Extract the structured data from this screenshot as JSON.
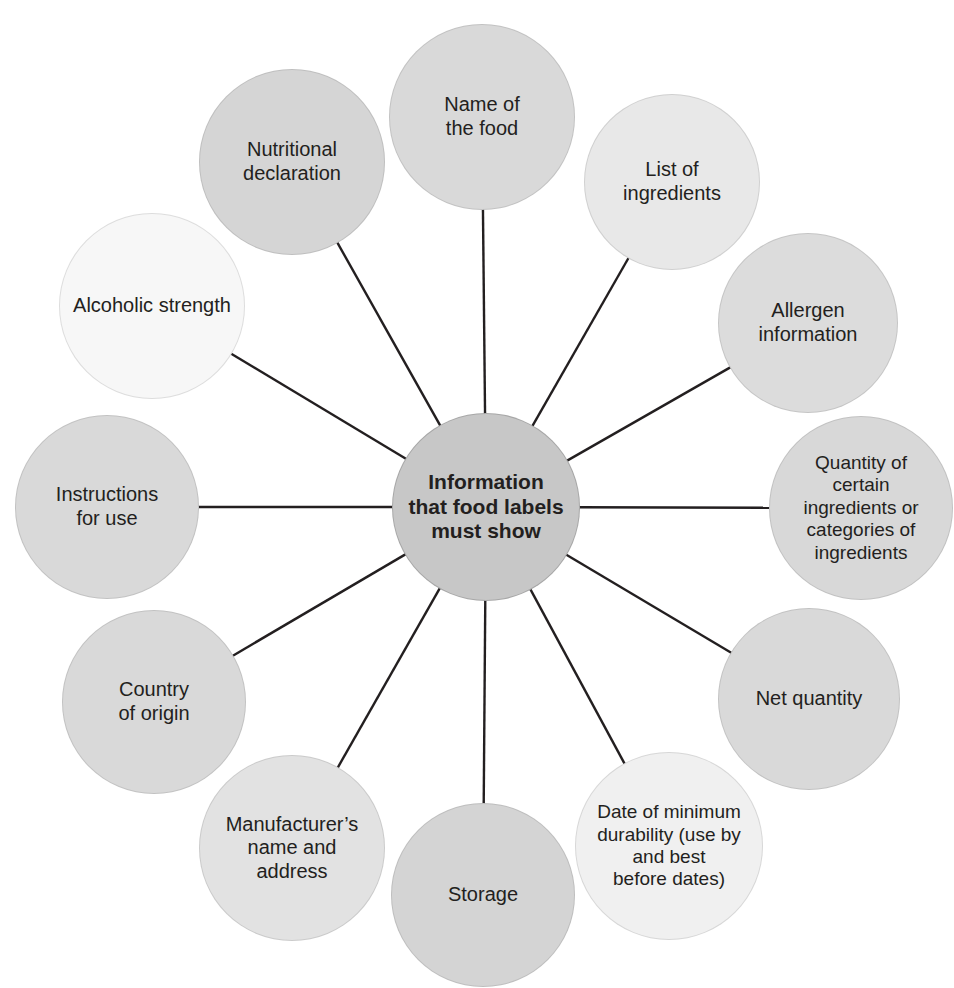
{
  "diagram": {
    "type": "hub-and-spoke",
    "title": "Information that food labels must show",
    "center": {
      "label": "Information\nthat food labels\nmust show",
      "cx": 486,
      "cy": 507,
      "r": 94,
      "fill": "#c7c7c7",
      "font_size": 21,
      "bold": true
    },
    "line_color": "#231f20",
    "line_width": 2.4,
    "background": "#ffffff",
    "nodes": [
      {
        "id": "name-of-the-food",
        "label": "Name of\nthe food",
        "cx": 482,
        "cy": 117,
        "r": 93,
        "fill": "#d9d9d9",
        "font_size": 20
      },
      {
        "id": "list-of-ingredients",
        "label": "List of\ningredients",
        "cx": 672,
        "cy": 182,
        "r": 88,
        "fill": "#e8e8e8",
        "font_size": 20
      },
      {
        "id": "allergen-information",
        "label": "Allergen\ninformation",
        "cx": 808,
        "cy": 323,
        "r": 90,
        "fill": "#dcdcdc",
        "font_size": 20
      },
      {
        "id": "quantity-of-certain-ingredients",
        "label": "Quantity of\ncertain\ningredients or\ncategories of\ningredients",
        "cx": 861,
        "cy": 508,
        "r": 92,
        "fill": "#d8d8d8",
        "font_size": 19
      },
      {
        "id": "net-quantity",
        "label": "Net quantity",
        "cx": 809,
        "cy": 699,
        "r": 91,
        "fill": "#d9d9d9",
        "font_size": 20
      },
      {
        "id": "date-of-minimum-durability",
        "label": "Date of minimum\ndurability (use by\nand best\nbefore dates)",
        "cx": 669,
        "cy": 846,
        "r": 94,
        "fill": "#f0f0f0",
        "font_size": 19
      },
      {
        "id": "storage",
        "label": "Storage",
        "cx": 483,
        "cy": 895,
        "r": 92,
        "fill": "#d4d4d4",
        "font_size": 20
      },
      {
        "id": "manufacturers-name-and-address",
        "label": "Manufacturer’s\nname and\naddress",
        "cx": 292,
        "cy": 848,
        "r": 93,
        "fill": "#e2e2e2",
        "font_size": 20
      },
      {
        "id": "country-of-origin",
        "label": "Country\nof origin",
        "cx": 154,
        "cy": 702,
        "r": 92,
        "fill": "#d9d9d9",
        "font_size": 20
      },
      {
        "id": "instructions-for-use",
        "label": "Instructions\nfor use",
        "cx": 107,
        "cy": 507,
        "r": 92,
        "fill": "#d9d9d9",
        "font_size": 20
      },
      {
        "id": "alcoholic-strength",
        "label": "Alcoholic strength",
        "cx": 152,
        "cy": 306,
        "r": 93,
        "fill": "#f7f7f7",
        "font_size": 20
      },
      {
        "id": "nutritional-declaration",
        "label": "Nutritional\ndeclaration",
        "cx": 292,
        "cy": 162,
        "r": 93,
        "fill": "#d5d5d5",
        "font_size": 20
      }
    ]
  }
}
